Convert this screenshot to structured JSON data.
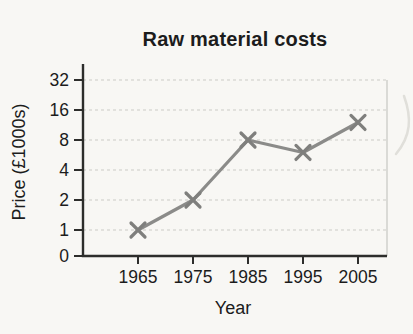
{
  "title": "Raw material costs",
  "colors": {
    "background": "#f8f7f4",
    "axis": "#2d2d2b",
    "text": "#1c1c1c",
    "grid": "#cbcbc6",
    "plot_border": "#c6c6c1",
    "series_line": "#8b8b89",
    "marker": "#7f7f7d",
    "artifact": "#e0dfda"
  },
  "chart_data": {
    "type": "line",
    "title": "Raw material costs",
    "xlabel": "Year",
    "ylabel": "Price (£1000s)",
    "categories": [
      "1965",
      "1975",
      "1985",
      "1995",
      "2005"
    ],
    "values": [
      1,
      2,
      8,
      6,
      12
    ],
    "y_ticks": [
      0,
      1,
      2,
      4,
      8,
      16,
      32
    ],
    "y_scale": "doubling (log2); equal spacing per doubling, 0 at baseline",
    "ylim": [
      0,
      32
    ],
    "marker": "x",
    "grid": "horizontal, light dashed",
    "legend": "none",
    "series": [
      {
        "name": "Raw material price",
        "values": [
          1,
          2,
          8,
          6,
          12
        ]
      }
    ]
  }
}
